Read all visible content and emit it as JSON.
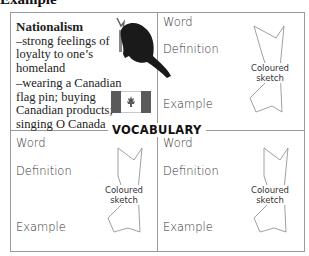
{
  "heading": "Example",
  "center_label": "VOCABULARY",
  "example_cell": {
    "term": "Nationalism",
    "definition": "–strong feelings of loyalty to one’s homeland",
    "example": "–wearing a Canadian flag pin; buying Canadian products; singing O Canada",
    "images": [
      "beaver-icon",
      "canadian-flag-icon"
    ]
  },
  "cells": [
    {
      "word_label": "Word",
      "definition_label": "Definition",
      "example_label": "Example",
      "sketch_label_line1": "Coloured",
      "sketch_label_line2": "sketch"
    },
    {
      "word_label": "Word",
      "definition_label": "Definition",
      "example_label": "Example",
      "sketch_label_line1": "Coloured",
      "sketch_label_line2": "sketch"
    },
    {
      "word_label": "Word",
      "definition_label": "Definition",
      "example_label": "Example",
      "sketch_label_line1": "Coloured",
      "sketch_label_line2": "sketch"
    }
  ],
  "colors": {
    "border": "#9a9a9a",
    "flag_red": "#5a5a5a",
    "text": "#222222"
  }
}
